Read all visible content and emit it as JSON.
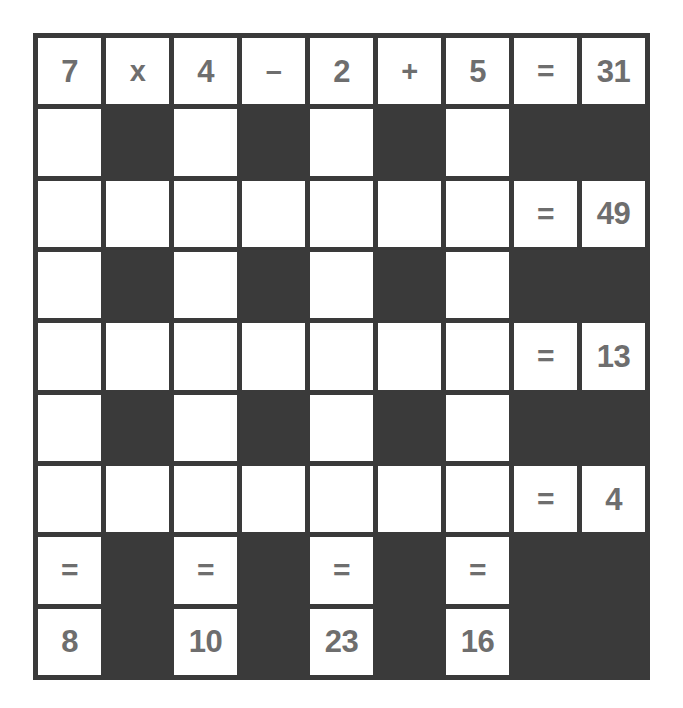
{
  "puzzle": {
    "type": "arithmetic-crossword",
    "rows": 9,
    "columns": 9,
    "colors": {
      "background": "#ffffff",
      "grid_line": "#3a3a3a",
      "block": "#3a3a3a",
      "cell": "#ffffff",
      "text": "#6e6e6e"
    },
    "symbols": {
      "multiply": "x",
      "minus": "–",
      "plus": "+",
      "equals": "="
    },
    "row_equations": [
      {
        "row": 1,
        "expression": "7 x 4 – 2 + 5",
        "result": "31"
      },
      {
        "row": 3,
        "expression": "",
        "result": "49"
      },
      {
        "row": 5,
        "expression": "",
        "result": "13"
      },
      {
        "row": 7,
        "expression": "",
        "result": "4"
      }
    ],
    "column_results": [
      {
        "column": 1,
        "result": "8"
      },
      {
        "column": 3,
        "result": "10"
      },
      {
        "column": 5,
        "result": "23"
      },
      {
        "column": 7,
        "result": "16"
      }
    ],
    "cells": [
      [
        {
          "kind": "open",
          "text": "7"
        },
        {
          "kind": "open",
          "text": "x"
        },
        {
          "kind": "open",
          "text": "4"
        },
        {
          "kind": "open",
          "text": "–"
        },
        {
          "kind": "open",
          "text": "2"
        },
        {
          "kind": "open",
          "text": "+"
        },
        {
          "kind": "open",
          "text": "5"
        },
        {
          "kind": "open",
          "text": "="
        },
        {
          "kind": "open",
          "text": "31"
        }
      ],
      [
        {
          "kind": "open",
          "text": ""
        },
        {
          "kind": "block",
          "text": ""
        },
        {
          "kind": "open",
          "text": ""
        },
        {
          "kind": "block",
          "text": ""
        },
        {
          "kind": "open",
          "text": ""
        },
        {
          "kind": "block",
          "text": ""
        },
        {
          "kind": "open",
          "text": ""
        },
        {
          "kind": "block",
          "text": ""
        },
        {
          "kind": "block",
          "text": ""
        }
      ],
      [
        {
          "kind": "open",
          "text": ""
        },
        {
          "kind": "open",
          "text": ""
        },
        {
          "kind": "open",
          "text": ""
        },
        {
          "kind": "open",
          "text": ""
        },
        {
          "kind": "open",
          "text": ""
        },
        {
          "kind": "open",
          "text": ""
        },
        {
          "kind": "open",
          "text": ""
        },
        {
          "kind": "open",
          "text": "="
        },
        {
          "kind": "open",
          "text": "49"
        }
      ],
      [
        {
          "kind": "open",
          "text": ""
        },
        {
          "kind": "block",
          "text": ""
        },
        {
          "kind": "open",
          "text": ""
        },
        {
          "kind": "block",
          "text": ""
        },
        {
          "kind": "open",
          "text": ""
        },
        {
          "kind": "block",
          "text": ""
        },
        {
          "kind": "open",
          "text": ""
        },
        {
          "kind": "block",
          "text": ""
        },
        {
          "kind": "block",
          "text": ""
        }
      ],
      [
        {
          "kind": "open",
          "text": ""
        },
        {
          "kind": "open",
          "text": ""
        },
        {
          "kind": "open",
          "text": ""
        },
        {
          "kind": "open",
          "text": ""
        },
        {
          "kind": "open",
          "text": ""
        },
        {
          "kind": "open",
          "text": ""
        },
        {
          "kind": "open",
          "text": ""
        },
        {
          "kind": "open",
          "text": "="
        },
        {
          "kind": "open",
          "text": "13"
        }
      ],
      [
        {
          "kind": "open",
          "text": ""
        },
        {
          "kind": "block",
          "text": ""
        },
        {
          "kind": "open",
          "text": ""
        },
        {
          "kind": "block",
          "text": ""
        },
        {
          "kind": "open",
          "text": ""
        },
        {
          "kind": "block",
          "text": ""
        },
        {
          "kind": "open",
          "text": ""
        },
        {
          "kind": "block",
          "text": ""
        },
        {
          "kind": "block",
          "text": ""
        }
      ],
      [
        {
          "kind": "open",
          "text": ""
        },
        {
          "kind": "open",
          "text": ""
        },
        {
          "kind": "open",
          "text": ""
        },
        {
          "kind": "open",
          "text": ""
        },
        {
          "kind": "open",
          "text": ""
        },
        {
          "kind": "open",
          "text": ""
        },
        {
          "kind": "open",
          "text": ""
        },
        {
          "kind": "open",
          "text": "="
        },
        {
          "kind": "open",
          "text": "4"
        }
      ],
      [
        {
          "kind": "open",
          "text": "="
        },
        {
          "kind": "block",
          "text": ""
        },
        {
          "kind": "open",
          "text": "="
        },
        {
          "kind": "block",
          "text": ""
        },
        {
          "kind": "open",
          "text": "="
        },
        {
          "kind": "block",
          "text": ""
        },
        {
          "kind": "open",
          "text": "="
        },
        {
          "kind": "block",
          "text": ""
        },
        {
          "kind": "block",
          "text": ""
        }
      ],
      [
        {
          "kind": "open",
          "text": "8"
        },
        {
          "kind": "block",
          "text": ""
        },
        {
          "kind": "open",
          "text": "10"
        },
        {
          "kind": "block",
          "text": ""
        },
        {
          "kind": "open",
          "text": "23"
        },
        {
          "kind": "block",
          "text": ""
        },
        {
          "kind": "open",
          "text": "16"
        },
        {
          "kind": "block",
          "text": ""
        },
        {
          "kind": "block",
          "text": ""
        }
      ]
    ]
  }
}
